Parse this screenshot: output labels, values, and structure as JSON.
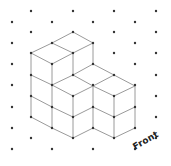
{
  "diagram": {
    "type": "isometric-cube-drawing",
    "label": "Front",
    "colors": {
      "background": "#ffffff",
      "dot": "#333333",
      "edge": "#9a9a9a",
      "vertex": "#333333",
      "label": "#222222"
    },
    "grid": {
      "columns": [
        {
          "x": 12,
          "ys": [
            22,
            43,
            64,
            85,
            107,
            128,
            149
          ]
        },
        {
          "x": 31,
          "ys": [
            11,
            32,
            53,
            75,
            96,
            117,
            138
          ]
        },
        {
          "x": 52,
          "ys": [
            22,
            43,
            64,
            85,
            107,
            128,
            149
          ]
        },
        {
          "x": 73,
          "ys": [
            11,
            32,
            53,
            75,
            96,
            117,
            138
          ]
        },
        {
          "x": 93,
          "ys": [
            22,
            43,
            64,
            85,
            107,
            128,
            149
          ]
        },
        {
          "x": 114,
          "ys": [
            11,
            32,
            53,
            75,
            96,
            117,
            138
          ]
        },
        {
          "x": 135,
          "ys": [
            22,
            43,
            64,
            85,
            107,
            128,
            149
          ]
        },
        {
          "x": 156,
          "ys": [
            11,
            32,
            53,
            75,
            96,
            117,
            138
          ]
        }
      ]
    },
    "edges": [
      [
        73,
        32,
        52,
        43
      ],
      [
        73,
        32,
        93,
        43
      ],
      [
        52,
        43,
        31,
        53
      ],
      [
        52,
        43,
        73,
        53
      ],
      [
        93,
        43,
        73,
        53
      ],
      [
        31,
        53,
        52,
        64
      ],
      [
        73,
        53,
        52,
        64
      ],
      [
        31,
        53,
        31,
        117
      ],
      [
        52,
        64,
        52,
        128
      ],
      [
        73,
        53,
        73,
        75
      ],
      [
        73,
        96,
        73,
        138
      ],
      [
        93,
        43,
        93,
        64
      ],
      [
        93,
        86,
        93,
        128
      ],
      [
        114,
        96,
        114,
        138
      ],
      [
        135,
        86,
        135,
        128
      ],
      [
        31,
        75,
        52,
        85
      ],
      [
        31,
        96,
        52,
        107
      ],
      [
        31,
        117,
        52,
        128
      ],
      [
        52,
        85,
        73,
        75
      ],
      [
        73,
        75,
        93,
        64
      ],
      [
        93,
        64,
        114,
        75
      ],
      [
        114,
        75,
        135,
        86
      ],
      [
        73,
        75,
        93,
        86
      ],
      [
        93,
        86,
        114,
        75
      ],
      [
        52,
        85,
        73,
        96
      ],
      [
        73,
        96,
        93,
        86
      ],
      [
        93,
        86,
        114,
        96
      ],
      [
        114,
        96,
        135,
        86
      ],
      [
        52,
        107,
        73,
        117
      ],
      [
        52,
        128,
        73,
        138
      ],
      [
        73,
        117,
        93,
        107
      ],
      [
        73,
        138,
        93,
        128
      ],
      [
        93,
        107,
        114,
        117
      ],
      [
        93,
        128,
        114,
        138
      ],
      [
        114,
        117,
        135,
        107
      ],
      [
        114,
        138,
        135,
        128
      ]
    ]
  }
}
